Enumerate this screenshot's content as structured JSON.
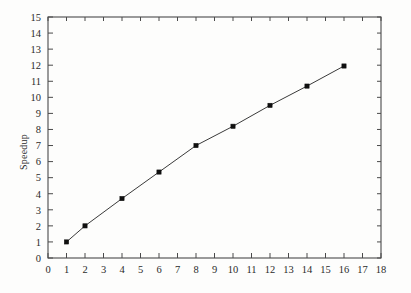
{
  "chart_data": {
    "type": "line",
    "title": "",
    "subtitle": "",
    "xlabel": "",
    "ylabel": "Speedup",
    "xlim": [
      0,
      18
    ],
    "ylim": [
      0,
      15
    ],
    "xticks": [
      0,
      1,
      2,
      3,
      4,
      5,
      6,
      7,
      8,
      9,
      10,
      11,
      12,
      13,
      14,
      15,
      16,
      17,
      18
    ],
    "yticks": [
      0,
      1,
      2,
      3,
      4,
      5,
      6,
      7,
      8,
      9,
      10,
      11,
      12,
      13,
      14,
      15
    ],
    "xtick_labels": [
      "0",
      "1",
      "2",
      "3",
      "4",
      "5",
      "6",
      "7",
      "8",
      "9",
      "10",
      "11",
      "12",
      "13",
      "14",
      "15",
      "16",
      "17",
      "18"
    ],
    "ytick_labels": [
      "0",
      "1",
      "2",
      "3",
      "4",
      "5",
      "6",
      "7",
      "8",
      "9",
      "10",
      "11",
      "12",
      "13",
      "14",
      "15"
    ],
    "grid": false,
    "legend": null,
    "legend_position": "none",
    "marker": "filled-square",
    "line_color": "#3a3a3a",
    "marker_color": "#101010",
    "axis_color": "#4a4a4a",
    "background_color": "#fdfdfc",
    "x": [
      1,
      2,
      4,
      6,
      8,
      10,
      12,
      14,
      16
    ],
    "y": [
      1.0,
      2.0,
      3.7,
      5.35,
      7.0,
      8.2,
      9.5,
      10.7,
      11.95
    ],
    "series": [
      {
        "name": "Speedup",
        "points": [
          {
            "x": 1,
            "y": 1.0
          },
          {
            "x": 2,
            "y": 2.0
          },
          {
            "x": 4,
            "y": 3.7
          },
          {
            "x": 6,
            "y": 5.35
          },
          {
            "x": 8,
            "y": 7.0
          },
          {
            "x": 10,
            "y": 8.2
          },
          {
            "x": 12,
            "y": 9.5
          },
          {
            "x": 14,
            "y": 10.7
          },
          {
            "x": 16,
            "y": 11.95
          }
        ]
      }
    ]
  }
}
